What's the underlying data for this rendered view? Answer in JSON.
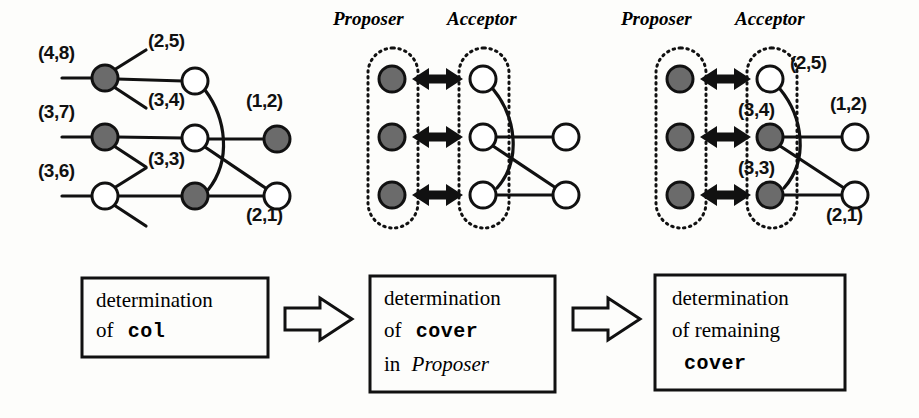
{
  "figure": {
    "background": "#fdfdfb",
    "ink": "#111111",
    "filled_node_color": "#6b6b6b",
    "open_node_color": "#ffffff"
  },
  "panels": [
    {
      "id": "left",
      "name": "col-determination-graph",
      "node_labels": [
        {
          "text": "(4,8)",
          "x": 38,
          "y": 52,
          "node": "n48"
        },
        {
          "text": "(2,5)",
          "x": 148,
          "y": 40,
          "node": "n25"
        },
        {
          "text": "(3,7)",
          "x": 38,
          "y": 110,
          "node": "n37"
        },
        {
          "text": "(3,4)",
          "x": 148,
          "y": 100,
          "node": "n34"
        },
        {
          "text": "(1,2)",
          "x": 246,
          "y": 100,
          "node": "n12"
        },
        {
          "text": "(3,6)",
          "x": 38,
          "y": 168,
          "node": "n36"
        },
        {
          "text": "(3,3)",
          "x": 148,
          "y": 158,
          "node": "n33"
        },
        {
          "text": "(2,1)",
          "x": 246,
          "y": 206,
          "node": "n21"
        }
      ],
      "nodes": [
        {
          "id": "n48",
          "x": 105,
          "y": 78,
          "fill": "filled"
        },
        {
          "id": "n25",
          "x": 195,
          "y": 81,
          "fill": "open"
        },
        {
          "id": "n37",
          "x": 105,
          "y": 137,
          "fill": "filled"
        },
        {
          "id": "n34",
          "x": 195,
          "y": 138,
          "fill": "open"
        },
        {
          "id": "n12",
          "x": 277,
          "y": 139,
          "fill": "filled"
        },
        {
          "id": "n36",
          "x": 105,
          "y": 196,
          "fill": "open"
        },
        {
          "id": "n33",
          "x": 195,
          "y": 196,
          "fill": "filled"
        },
        {
          "id": "n21",
          "x": 277,
          "y": 196,
          "fill": "open"
        }
      ]
    },
    {
      "id": "middle",
      "name": "cover-in-proposer-graph",
      "headers": [
        {
          "text": "Proposer",
          "x": 333,
          "y": 12
        },
        {
          "text": "Acceptor",
          "x": 447,
          "y": 12
        }
      ],
      "nodes": [
        {
          "id": "p1",
          "x": 392,
          "y": 79,
          "fill": "filled"
        },
        {
          "id": "p2",
          "x": 392,
          "y": 137,
          "fill": "filled"
        },
        {
          "id": "p3",
          "x": 392,
          "y": 195,
          "fill": "filled"
        },
        {
          "id": "a1",
          "x": 483,
          "y": 79,
          "fill": "open"
        },
        {
          "id": "a2",
          "x": 483,
          "y": 137,
          "fill": "open"
        },
        {
          "id": "a3",
          "x": 483,
          "y": 195,
          "fill": "open"
        },
        {
          "id": "r2",
          "x": 566,
          "y": 137,
          "fill": "open"
        },
        {
          "id": "r3",
          "x": 566,
          "y": 195,
          "fill": "open"
        }
      ]
    },
    {
      "id": "right",
      "name": "remaining-cover-graph",
      "headers": [
        {
          "text": "Proposer",
          "x": 621,
          "y": 12
        },
        {
          "text": "Acceptor",
          "x": 735,
          "y": 12
        }
      ],
      "node_labels": [
        {
          "text": "(2,5)",
          "x": 790,
          "y": 58,
          "node": "a1"
        },
        {
          "text": "(3,4)",
          "x": 738,
          "y": 106,
          "node": "a2"
        },
        {
          "text": "(1,2)",
          "x": 830,
          "y": 100,
          "node": "r2"
        },
        {
          "text": "(3,3)",
          "x": 738,
          "y": 164,
          "node": "a3"
        },
        {
          "text": "(2,1)",
          "x": 826,
          "y": 206,
          "node": "r3"
        }
      ],
      "nodes": [
        {
          "id": "p1",
          "x": 680,
          "y": 79,
          "fill": "filled"
        },
        {
          "id": "p2",
          "x": 680,
          "y": 137,
          "fill": "filled"
        },
        {
          "id": "p3",
          "x": 680,
          "y": 195,
          "fill": "filled"
        },
        {
          "id": "a1",
          "x": 770,
          "y": 79,
          "fill": "open"
        },
        {
          "id": "a2",
          "x": 770,
          "y": 137,
          "fill": "filled"
        },
        {
          "id": "a3",
          "x": 770,
          "y": 195,
          "fill": "filled"
        },
        {
          "id": "r2",
          "x": 855,
          "y": 137,
          "fill": "open"
        },
        {
          "id": "r3",
          "x": 855,
          "y": 195,
          "fill": "open"
        }
      ]
    }
  ],
  "flow": {
    "steps": [
      {
        "id": "step1",
        "name": "determination-of-col",
        "line1": "determination",
        "line2_plain": "of",
        "line2_mono": "col",
        "box": {
          "x": 82,
          "y": 278,
          "w": 186,
          "h": 79
        }
      },
      {
        "id": "step2",
        "name": "determination-of-cover-in-proposer",
        "line1": "determination",
        "line2_plain": "of",
        "line2_mono": "cover",
        "line3_plain": "in",
        "line3_italic": "Proposer",
        "box": {
          "x": 370,
          "y": 276,
          "w": 185,
          "h": 116
        }
      },
      {
        "id": "step3",
        "name": "determination-of-remaining-cover",
        "line1": "determination",
        "line2_plain": "of remaining",
        "line3_mono": "cover",
        "box": {
          "x": 655,
          "y": 275,
          "w": 190,
          "h": 115
        }
      }
    ],
    "arrows": [
      {
        "id": "arrow1",
        "name": "flow-arrow-1",
        "x": 285,
        "y": 318
      },
      {
        "id": "arrow2",
        "name": "flow-arrow-2",
        "x": 573,
        "y": 318
      }
    ]
  }
}
